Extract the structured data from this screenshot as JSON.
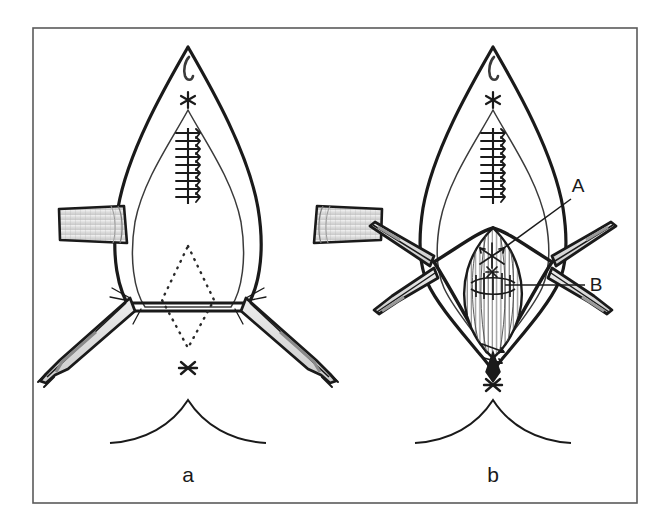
{
  "figure": {
    "kind": "surgical-illustration",
    "background_color": "#ffffff",
    "ink_color": "#1a1a1a",
    "shading_color": "#d9d9d9",
    "frame": {
      "name": "figure-border",
      "x": 33,
      "y": 28,
      "width": 604,
      "height": 475,
      "stroke": "#5a5a5a",
      "stroke_width": 1.6
    },
    "panels": [
      {
        "id": "a",
        "caption": "a",
        "caption_x": 188,
        "caption_y": 482,
        "center_x": 188,
        "description": "Closed deep layer with running suture; wound edges held by two retractor bands and paired forceps; dotted rhombus marks planned excision.",
        "markers": [
          {
            "name": "asterisk-upper",
            "glyph": "*",
            "x": 188,
            "y": 100
          },
          {
            "name": "asterisk-lower",
            "glyph": "*",
            "x": 188,
            "y": 368
          }
        ],
        "suture_line": {
          "name": "running-suture-a",
          "x": 188,
          "y_top": 130,
          "y_bottom": 200,
          "stitch_count": 9
        },
        "retractor_bands": 2,
        "forceps_arms": 2,
        "dotted_outline": "rhombus"
      },
      {
        "id": "b",
        "caption": "b",
        "caption_x": 493,
        "caption_y": 482,
        "center_x": 493,
        "description": "Four retractors open a diamond window exposing the striated muscle flap; callouts A and B indicate the apical suture and the transverse muscle closure.",
        "markers": [
          {
            "name": "asterisk-upper",
            "glyph": "*",
            "x": 493,
            "y": 100
          },
          {
            "name": "asterisk-lower",
            "glyph": "*",
            "x": 493,
            "y": 385
          }
        ],
        "suture_line": {
          "name": "running-suture-b",
          "x": 493,
          "y_top": 130,
          "y_bottom": 200,
          "stitch_count": 9
        },
        "retractor_bands": 4,
        "callouts": [
          {
            "name": "callout-a",
            "label": "A",
            "label_x": 578,
            "label_y": 192,
            "leader_from_x": 571,
            "leader_from_y": 199,
            "leader_to_x": 497,
            "leader_to_y": 253
          },
          {
            "name": "callout-b",
            "label": "B",
            "label_x": 596,
            "label_y": 291,
            "leader_from_x": 585,
            "leader_from_y": 285,
            "leader_to_x": 505,
            "leader_to_y": 285
          }
        ]
      }
    ]
  }
}
